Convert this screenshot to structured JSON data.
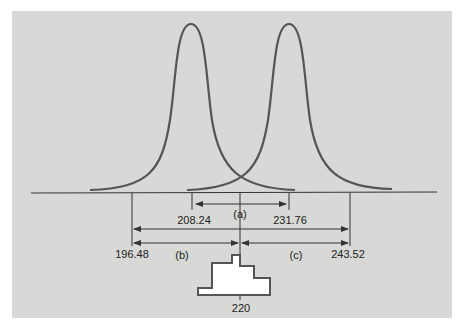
{
  "figure": {
    "background_color": "#d8d8d6",
    "curve_color": "#555555",
    "line_color": "#333333",
    "labels": {
      "a": "(a)",
      "b": "(b)",
      "c": "(c)",
      "v208": "208.24",
      "v231": "231.76",
      "v196": "196.48",
      "v243": "243.52",
      "center": "220"
    }
  },
  "diagram": {
    "type": "tolerance-interval diagram",
    "center_value": 220,
    "curves": [
      {
        "name": "left distribution",
        "peak_value": 208.24
      },
      {
        "name": "right distribution",
        "peak_value": 231.76
      }
    ],
    "intervals": [
      {
        "label": "(a)",
        "from": 208.24,
        "to": 231.76
      },
      {
        "label": "(b)",
        "from": 196.48,
        "to": 220
      },
      {
        "label": "(c)",
        "from": 220,
        "to": 243.52
      },
      {
        "label": "full",
        "from": 196.48,
        "to": 243.52
      }
    ]
  }
}
